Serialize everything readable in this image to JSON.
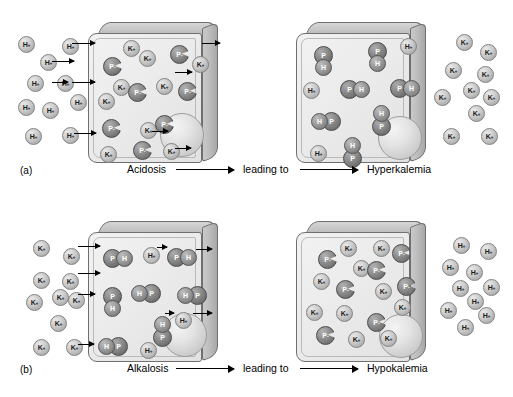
{
  "figure": {
    "panels": [
      {
        "id": "a",
        "label": "(a)",
        "caption_start": "Acidosis",
        "caption_middle": "leading to",
        "caption_end": "Hyperkalemia",
        "left_cell": {
          "name": "acidosis-cell",
          "outside_ions": [
            {
              "label": "H",
              "charge": "+",
              "x": 18,
              "y": 36
            },
            {
              "label": "H",
              "charge": "+",
              "x": 62,
              "y": 38
            },
            {
              "label": "H",
              "charge": "+",
              "x": 40,
              "y": 54
            },
            {
              "label": "H",
              "charge": "+",
              "x": 27,
              "y": 75
            },
            {
              "label": "H",
              "charge": "+",
              "x": 57,
              "y": 75
            },
            {
              "label": "H",
              "charge": "+",
              "x": 70,
              "y": 94
            },
            {
              "label": "H",
              "charge": "+",
              "x": 18,
              "y": 99
            },
            {
              "label": "H",
              "charge": "+",
              "x": 42,
              "y": 102
            },
            {
              "label": "H",
              "charge": "+",
              "x": 25,
              "y": 128
            },
            {
              "label": "H",
              "charge": "+",
              "x": 62,
              "y": 127
            }
          ],
          "inside_ions": [
            {
              "label": "K",
              "charge": "+",
              "x": 123,
              "y": 40
            },
            {
              "label": "K",
              "charge": "+",
              "x": 139,
              "y": 50
            },
            {
              "label": "K",
              "charge": "+",
              "x": 113,
              "y": 79
            },
            {
              "label": "K",
              "charge": "+",
              "x": 98,
              "y": 93
            },
            {
              "label": "K",
              "charge": "+",
              "x": 156,
              "y": 78
            },
            {
              "label": "K",
              "charge": "+",
              "x": 192,
              "y": 56
            },
            {
              "label": "K",
              "charge": "+",
              "x": 140,
              "y": 122
            },
            {
              "label": "K",
              "charge": "+",
              "x": 100,
              "y": 146
            },
            {
              "label": "K",
              "charge": "+",
              "x": 163,
              "y": 143
            }
          ],
          "inside_proteins": [
            {
              "label": "P",
              "charge": "-",
              "x": 103,
              "y": 57
            },
            {
              "label": "P",
              "charge": "-",
              "x": 170,
              "y": 45
            },
            {
              "label": "P",
              "charge": "-",
              "x": 128,
              "y": 83
            },
            {
              "label": "P",
              "charge": "-",
              "x": 178,
              "y": 82
            },
            {
              "label": "P",
              "charge": "-",
              "x": 102,
              "y": 119
            },
            {
              "label": "P",
              "charge": "-",
              "x": 155,
              "y": 115
            },
            {
              "label": "P",
              "charge": "-",
              "x": 133,
              "y": 141
            }
          ],
          "arrows": [
            {
              "x": 72,
              "y": 43,
              "w": 23
            },
            {
              "x": 52,
              "y": 61,
              "w": 22
            },
            {
              "x": 52,
              "y": 82,
              "w": 16
            },
            {
              "x": 72,
              "y": 82,
              "w": 23
            },
            {
              "x": 74,
              "y": 133,
              "w": 22
            },
            {
              "x": 175,
              "y": 72,
              "w": 17
            },
            {
              "x": 202,
              "y": 43,
              "w": 18
            },
            {
              "x": 152,
              "y": 131,
              "w": 16
            },
            {
              "x": 175,
              "y": 148,
              "w": 16
            }
          ],
          "nucleus": {
            "x": 160,
            "y": 113
          }
        },
        "right_cell": {
          "name": "hyperkalemia-cell",
          "complexes": [
            {
              "order": "ph",
              "vertical": true,
              "top": "P",
              "bottom": "H",
              "x": 313,
              "y": 46
            },
            {
              "order": "ph",
              "vertical": true,
              "top": "P",
              "bottom": "H",
              "x": 367,
              "y": 42
            },
            {
              "order": "ph",
              "vertical": false,
              "left": "P",
              "right": "H",
              "x": 340,
              "y": 80
            },
            {
              "order": "ph",
              "vertical": false,
              "left": "P",
              "right": "H",
              "x": 390,
              "y": 79
            },
            {
              "order": "hp",
              "vertical": false,
              "left": "H",
              "right": "P",
              "x": 311,
              "y": 112
            },
            {
              "order": "hp",
              "vertical": true,
              "top": "H",
              "bottom": "P",
              "x": 371,
              "y": 105
            },
            {
              "order": "hp",
              "vertical": true,
              "top": "H",
              "bottom": "P",
              "x": 342,
              "y": 137
            }
          ],
          "free_ions": [
            {
              "label": "H",
              "charge": "+",
              "x": 400,
              "y": 38
            },
            {
              "label": "H",
              "charge": "+",
              "x": 303,
              "y": 82
            },
            {
              "label": "H",
              "charge": "+",
              "x": 310,
              "y": 145
            }
          ],
          "outside_ions": [
            {
              "label": "K",
              "charge": "+",
              "x": 456,
              "y": 34
            },
            {
              "label": "K",
              "charge": "+",
              "x": 480,
              "y": 44
            },
            {
              "label": "K",
              "charge": "+",
              "x": 445,
              "y": 62
            },
            {
              "label": "K",
              "charge": "+",
              "x": 477,
              "y": 66
            },
            {
              "label": "K",
              "charge": "+",
              "x": 463,
              "y": 82
            },
            {
              "label": "K",
              "charge": "+",
              "x": 434,
              "y": 89
            },
            {
              "label": "K",
              "charge": "+",
              "x": 483,
              "y": 89
            },
            {
              "label": "K",
              "charge": "+",
              "x": 468,
              "y": 105
            },
            {
              "label": "K",
              "charge": "+",
              "x": 443,
              "y": 128
            },
            {
              "label": "K",
              "charge": "+",
              "x": 481,
              "y": 128
            }
          ],
          "nucleus": {
            "x": 378,
            "y": 116
          }
        }
      },
      {
        "id": "b",
        "label": "(b)",
        "caption_start": "Alkalosis",
        "caption_middle": "leading to",
        "caption_end": "Hypokalemia",
        "left_cell": {
          "name": "alkalosis-cell",
          "outside_ions": [
            {
              "label": "K",
              "charge": "+",
              "x": 33,
              "y": 41
            },
            {
              "label": "K",
              "charge": "+",
              "x": 63,
              "y": 49
            },
            {
              "label": "K",
              "charge": "+",
              "x": 33,
              "y": 73
            },
            {
              "label": "K",
              "charge": "+",
              "x": 62,
              "y": 74
            },
            {
              "label": "K",
              "charge": "+",
              "x": 52,
              "y": 90
            },
            {
              "label": "K",
              "charge": "+",
              "x": 26,
              "y": 95
            },
            {
              "label": "K",
              "charge": "+",
              "x": 68,
              "y": 93
            },
            {
              "label": "K",
              "charge": "+",
              "x": 50,
              "y": 116
            },
            {
              "label": "K",
              "charge": "+",
              "x": 33,
              "y": 140
            },
            {
              "label": "K",
              "charge": "+",
              "x": 66,
              "y": 140
            }
          ],
          "inside_complexes": [
            {
              "order": "ph",
              "vertical": false,
              "left": "P",
              "right": "H",
              "x": 103,
              "y": 50
            },
            {
              "order": "ph",
              "vertical": false,
              "left": "P",
              "right": "H",
              "x": 167,
              "y": 49
            },
            {
              "order": "hp",
              "vertical": false,
              "left": "H",
              "right": "P",
              "x": 131,
              "y": 85
            },
            {
              "order": "hp",
              "vertical": false,
              "left": "H",
              "right": "P",
              "x": 177,
              "y": 87
            },
            {
              "order": "ph",
              "vertical": true,
              "top": "P",
              "bottom": "H",
              "x": 102,
              "y": 88
            },
            {
              "order": "hp",
              "vertical": true,
              "top": "H",
              "bottom": "P",
              "x": 152,
              "y": 117
            },
            {
              "order": "hp",
              "vertical": false,
              "left": "H",
              "right": "P",
              "x": 98,
              "y": 138
            }
          ],
          "free_ions": [
            {
              "label": "H",
              "charge": "+",
              "x": 143,
              "y": 48
            },
            {
              "label": "H",
              "charge": "+",
              "x": 175,
              "y": 113
            },
            {
              "label": "H",
              "charge": "+",
              "x": 140,
              "y": 143
            }
          ],
          "arrows": [
            {
              "x": 78,
              "y": 47,
              "w": 22
            },
            {
              "x": 78,
              "y": 74,
              "w": 22
            },
            {
              "x": 78,
              "y": 95,
              "w": 17
            },
            {
              "x": 78,
              "y": 145,
              "w": 16
            },
            {
              "x": 157,
              "y": 48,
              "w": 10
            },
            {
              "x": 196,
              "y": 50,
              "w": 16
            },
            {
              "x": 165,
              "y": 114,
              "w": 9
            },
            {
              "x": 193,
              "y": 114,
              "w": 19
            }
          ],
          "nucleus": {
            "x": 163,
            "y": 114
          }
        },
        "right_cell": {
          "name": "hypokalemia-cell",
          "inside_ions": [
            {
              "label": "K",
              "charge": "+",
              "x": 340,
              "y": 41
            },
            {
              "label": "K",
              "charge": "+",
              "x": 373,
              "y": 41
            },
            {
              "label": "K",
              "charge": "+",
              "x": 353,
              "y": 61
            },
            {
              "label": "K",
              "charge": "+",
              "x": 313,
              "y": 74
            },
            {
              "label": "K",
              "charge": "+",
              "x": 375,
              "y": 84
            },
            {
              "label": "K",
              "charge": "+",
              "x": 394,
              "y": 100
            },
            {
              "label": "K",
              "charge": "+",
              "x": 306,
              "y": 105
            },
            {
              "label": "K",
              "charge": "+",
              "x": 336,
              "y": 106
            },
            {
              "label": "K",
              "charge": "+",
              "x": 348,
              "y": 132
            },
            {
              "label": "K",
              "charge": "+",
              "x": 380,
              "y": 131
            }
          ],
          "inside_proteins": [
            {
              "label": "P",
              "charge": "-",
              "x": 318,
              "y": 51
            },
            {
              "label": "P",
              "charge": "-",
              "x": 392,
              "y": 45
            },
            {
              "label": "P",
              "charge": "-",
              "x": 367,
              "y": 62
            },
            {
              "label": "P",
              "charge": "-",
              "x": 397,
              "y": 78
            },
            {
              "label": "P",
              "charge": "-",
              "x": 336,
              "y": 81
            },
            {
              "label": "P",
              "charge": "-",
              "x": 367,
              "y": 114
            },
            {
              "label": "P",
              "charge": "-",
              "x": 316,
              "y": 127
            }
          ],
          "outside_ions": [
            {
              "label": "H",
              "charge": "+",
              "x": 453,
              "y": 38
            },
            {
              "label": "H",
              "charge": "+",
              "x": 480,
              "y": 44
            },
            {
              "label": "H",
              "charge": "+",
              "x": 442,
              "y": 60
            },
            {
              "label": "H",
              "charge": "+",
              "x": 466,
              "y": 65
            },
            {
              "label": "H",
              "charge": "+",
              "x": 452,
              "y": 81
            },
            {
              "label": "H",
              "charge": "+",
              "x": 483,
              "y": 80
            },
            {
              "label": "H",
              "charge": "+",
              "x": 467,
              "y": 94
            },
            {
              "label": "H",
              "charge": "+",
              "x": 440,
              "y": 103
            },
            {
              "label": "H",
              "charge": "+",
              "x": 478,
              "y": 108
            },
            {
              "label": "H",
              "charge": "+",
              "x": 457,
              "y": 120
            }
          ],
          "nucleus": {
            "x": 379,
            "y": 115
          }
        }
      }
    ]
  }
}
